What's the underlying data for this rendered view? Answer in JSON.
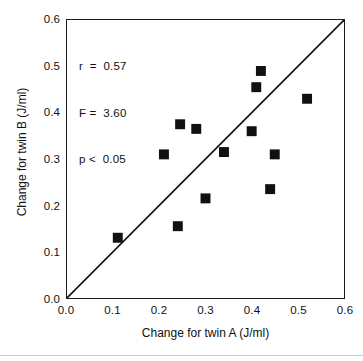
{
  "chart_data": {
    "type": "scatter",
    "title": "",
    "xlabel": "Change for twin A (J/ml)",
    "ylabel": "Change for twin B (J/ml)",
    "xlim": [
      0.0,
      0.6
    ],
    "ylim": [
      0.0,
      0.6
    ],
    "xticks": [
      "0.0",
      "0.1",
      "0.2",
      "0.3",
      "0.4",
      "0.5",
      "0.6"
    ],
    "yticks": [
      "0.0",
      "0.1",
      "0.2",
      "0.3",
      "0.4",
      "0.5",
      "0.6"
    ],
    "xtick_values": [
      0.0,
      0.1,
      0.2,
      0.3,
      0.4,
      0.5,
      0.6
    ],
    "ytick_values": [
      0.0,
      0.1,
      0.2,
      0.3,
      0.4,
      0.5,
      0.6
    ],
    "grid": false,
    "legend": false,
    "marker": {
      "shape": "square",
      "color": "#111111",
      "size_px": 10
    },
    "reference_line": {
      "name": "identity-line",
      "description": "y = x line of equality",
      "from": [
        0.0,
        0.0
      ],
      "to": [
        0.6,
        0.6
      ],
      "color": "#111111",
      "width_px": 1.6
    },
    "points": [
      {
        "x": 0.11,
        "y": 0.13
      },
      {
        "x": 0.21,
        "y": 0.31
      },
      {
        "x": 0.245,
        "y": 0.375
      },
      {
        "x": 0.24,
        "y": 0.155
      },
      {
        "x": 0.28,
        "y": 0.365
      },
      {
        "x": 0.3,
        "y": 0.215
      },
      {
        "x": 0.34,
        "y": 0.315
      },
      {
        "x": 0.4,
        "y": 0.36
      },
      {
        "x": 0.41,
        "y": 0.455
      },
      {
        "x": 0.42,
        "y": 0.49
      },
      {
        "x": 0.44,
        "y": 0.235
      },
      {
        "x": 0.45,
        "y": 0.31
      },
      {
        "x": 0.52,
        "y": 0.43
      }
    ],
    "annotations": {
      "line1": "r  =  0.57",
      "line2": "F =  3.60",
      "line3": "p <  0.05",
      "r": "0.57",
      "F": "3.60",
      "p": "< 0.05"
    }
  },
  "colors": {
    "axis": "#1a1a1a",
    "marker": "#111111",
    "text": "#111111",
    "background": "#ffffff"
  }
}
